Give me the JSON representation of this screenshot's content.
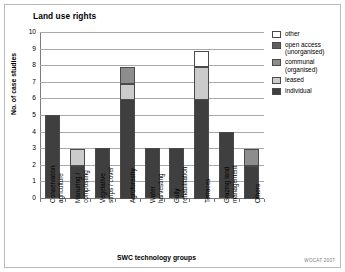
{
  "figure": {
    "title": "Land use rights",
    "credit": "WOCAT 2007"
  },
  "chart_data": {
    "type": "bar",
    "title": "Land use rights",
    "subtitle": "",
    "xlabel": "SWC technology groups",
    "ylabel": "No. of case studies",
    "ylim": [
      0,
      10
    ],
    "ytick_labels": [
      "0",
      "1",
      "2",
      "3",
      "4",
      "5",
      "6",
      "7",
      "8",
      "9",
      "10"
    ],
    "grid": true,
    "stacked": true,
    "legend_position": "right",
    "categories": [
      "Conservation agriculture",
      "Manuring / composting",
      "Vegetative strips / cover",
      "Agroforestry",
      "Water harvesting",
      "Gully rehabilitation",
      "Terraces",
      "Grazing land management",
      "Others"
    ],
    "category_lines": [
      [
        "Conservation",
        "agriculture"
      ],
      [
        "Manuring /",
        "composting"
      ],
      [
        "Vegetative",
        "strips / cover"
      ],
      [
        "Agroforestry"
      ],
      [
        "Water",
        "harvesting"
      ],
      [
        "Gully",
        "rehabilitation"
      ],
      [
        "Terraces"
      ],
      [
        "Grazing land",
        "management"
      ],
      [
        "Others"
      ]
    ],
    "series": [
      {
        "name": "individual",
        "color": "#3f3f3f",
        "values": [
          5,
          2,
          3,
          6,
          3,
          3,
          6,
          4,
          2
        ]
      },
      {
        "name": "leased",
        "color": "#cbcbcb",
        "values": [
          0,
          1,
          0,
          1,
          0,
          0,
          2,
          0,
          0
        ]
      },
      {
        "name": "communal (organised)",
        "color": "#8d8d8d",
        "values": [
          0,
          0,
          0,
          1,
          0,
          0,
          0,
          0,
          1
        ]
      },
      {
        "name": "open access (unorganised)",
        "color": "#5f5f5f",
        "values": [
          0,
          0,
          0,
          0,
          0,
          0,
          0,
          0,
          0
        ]
      },
      {
        "name": "other",
        "color": "#ffffff",
        "values": [
          0,
          0,
          0,
          0,
          0,
          0,
          1,
          0,
          0
        ]
      }
    ],
    "totals": [
      5,
      3,
      3,
      8,
      3,
      3,
      9,
      4,
      3
    ]
  },
  "legend": {
    "entries": [
      {
        "label": "other",
        "color": "#ffffff"
      },
      {
        "label": "open access (unorganised)",
        "color": "#5f5f5f"
      },
      {
        "label": "communal (organised)",
        "color": "#8d8d8d"
      },
      {
        "label": "leased",
        "color": "#cbcbcb"
      },
      {
        "label": "individual",
        "color": "#3f3f3f"
      }
    ]
  }
}
